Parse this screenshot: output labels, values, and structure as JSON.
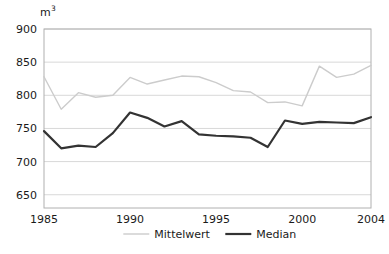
{
  "chart_data": {
    "type": "line",
    "title": "",
    "subtitle": "",
    "xlabel": "",
    "ylabel": "",
    "unit_label": "m",
    "unit_exponent": "3",
    "x": [
      1985,
      1986,
      1987,
      1988,
      1989,
      1990,
      1991,
      1992,
      1993,
      1994,
      1995,
      1996,
      1997,
      1998,
      1999,
      2000,
      2001,
      2002,
      2003,
      2004
    ],
    "xlim": [
      1985,
      2004
    ],
    "xticks": [
      1985,
      1990,
      1995,
      2000,
      2004
    ],
    "xtick_labels": [
      "1985",
      "1990",
      "1995",
      "2000",
      "2004"
    ],
    "ylim": [
      630,
      900
    ],
    "yticks": [
      650,
      700,
      750,
      800,
      850,
      900
    ],
    "ytick_labels": [
      "650",
      "700",
      "750",
      "800",
      "850",
      "900"
    ],
    "grid": true,
    "grid_axis": "y",
    "legend_position": "bottom",
    "series": [
      {
        "name": "Mittelwert",
        "color": "#cccccc",
        "width": 1.4,
        "values": [
          828,
          779,
          804,
          797,
          800,
          827,
          817,
          823,
          829,
          828,
          819,
          807,
          805,
          789,
          790,
          784,
          844,
          827,
          832,
          845
        ]
      },
      {
        "name": "Median",
        "color": "#333333",
        "width": 2.2,
        "values": [
          746,
          720,
          724,
          722,
          743,
          774,
          766,
          753,
          761,
          741,
          739,
          738,
          736,
          722,
          762,
          757,
          760,
          759,
          758,
          767
        ]
      }
    ]
  },
  "legend": {
    "items": [
      {
        "label": "Mittelwert",
        "color": "#cccccc"
      },
      {
        "label": "Median",
        "color": "#333333"
      }
    ]
  },
  "axes": {
    "plot_border_color": "#b0b0b0",
    "gridline_color": "#d8d8d8",
    "tick_text_color": "#1a1a1a"
  }
}
